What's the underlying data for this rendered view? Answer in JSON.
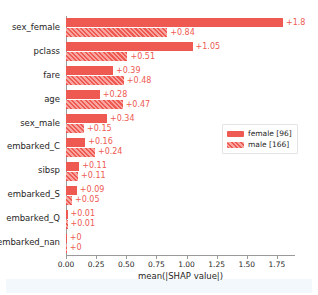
{
  "chart_data": {
    "type": "bar",
    "orientation": "horizontal",
    "title": "",
    "xlabel": "mean(|SHAP value|)",
    "ylabel": "",
    "xlim": [
      0.0,
      1.9
    ],
    "xticks": [
      "0.00",
      "0.25",
      "0.50",
      "0.75",
      "1.00",
      "1.25",
      "1.50",
      "1.75"
    ],
    "xtick_values": [
      0.0,
      0.25,
      0.5,
      0.75,
      1.0,
      1.25,
      1.5,
      1.75
    ],
    "grid": false,
    "legend_position": "center right",
    "categories": [
      "sex_female",
      "pclass",
      "fare",
      "age",
      "sex_male",
      "embarked_C",
      "sibsp",
      "embarked_S",
      "embarked_Q",
      "embarked_nan"
    ],
    "series": [
      {
        "name": "female [96]",
        "color": "#ee5a52",
        "fill": "solid",
        "values": [
          1.8,
          1.05,
          0.39,
          0.28,
          0.34,
          0.16,
          0.11,
          0.09,
          0.01,
          0
        ],
        "labels": [
          "+1.8",
          "+1.05",
          "+0.39",
          "+0.28",
          "+0.34",
          "+0.16",
          "+0.11",
          "+0.09",
          "+0.01",
          "+0"
        ]
      },
      {
        "name": "male [166]",
        "color": "#ee5a52",
        "fill": "hatched",
        "values": [
          0.84,
          0.51,
          0.48,
          0.47,
          0.15,
          0.24,
          0.1,
          0.05,
          0.01,
          0
        ],
        "labels": [
          "+0.84",
          "+0.51",
          "+0.48",
          "+0.47",
          "+0.15",
          "+0.24",
          "+0.11",
          "+0.05",
          "+0.01",
          "+0"
        ]
      }
    ],
    "legend": [
      {
        "label": "female [96]",
        "fill": "solid"
      },
      {
        "label": "male [166]",
        "fill": "hatched"
      }
    ],
    "accent_color": "#ee5a52"
  }
}
